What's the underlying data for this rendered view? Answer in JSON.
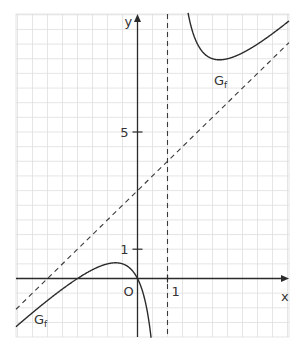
{
  "chart_data": {
    "type": "line",
    "title": "",
    "xlabel": "x",
    "ylabel": "y",
    "origin_label": "O",
    "x_ticks": [
      {
        "value": 1,
        "label": "1"
      }
    ],
    "y_ticks": [
      {
        "value": 1,
        "label": "1"
      },
      {
        "value": 5,
        "label": "5"
      }
    ],
    "xlim": [
      -4.05,
      5.0
    ],
    "ylim": [
      -2.0,
      9.1
    ],
    "grid": true,
    "grid_step": 0.5,
    "function": {
      "name": "f",
      "label": "G",
      "label_subscript": "f",
      "formula": "f(x) = x + 3 + 3/(x - 1)",
      "vertical_asymptote": 1,
      "oblique_asymptote": {
        "slope": 1,
        "intercept": 3
      },
      "zeros": [
        -2,
        0
      ],
      "local_max": {
        "x": -0.732,
        "y": 0.536
      },
      "local_min": {
        "x": 2.732,
        "y": 7.464
      }
    },
    "series": [
      {
        "name": "G_f left branch",
        "points": [
          [
            -4.0,
            -1.6
          ],
          [
            -3.0,
            -0.75
          ],
          [
            -2.0,
            0.0
          ],
          [
            -1.0,
            0.5
          ],
          [
            -0.732,
            0.536
          ],
          [
            0.0,
            0.0
          ],
          [
            0.5,
            -2.5
          ]
        ]
      },
      {
        "name": "G_f right branch",
        "points": [
          [
            1.4,
            11.9
          ],
          [
            2.0,
            8.0
          ],
          [
            2.732,
            7.464
          ],
          [
            3.0,
            7.5
          ],
          [
            4.0,
            8.0
          ],
          [
            5.0,
            8.75
          ]
        ]
      },
      {
        "name": "asymptote y = x + 3",
        "style": "dashed",
        "points": [
          [
            -4.0,
            -1.0
          ],
          [
            5.0,
            8.0
          ]
        ]
      },
      {
        "name": "asymptote x = 1",
        "style": "dashed",
        "points": [
          [
            1,
            -2.0
          ],
          [
            1,
            9.1
          ]
        ]
      }
    ],
    "annotations": [
      {
        "text": "G_f",
        "near": [
          2.5,
          6.4
        ]
      },
      {
        "text": "G_f",
        "near": [
          -3.4,
          -1.5
        ]
      }
    ]
  },
  "layout": {
    "origin_px": [
      137.5,
      278.5
    ],
    "unit_x_px": 30,
    "unit_y_px": 29.3,
    "grid_box": {
      "left": 16,
      "top": 14,
      "right": 289,
      "bottom": 337
    }
  }
}
